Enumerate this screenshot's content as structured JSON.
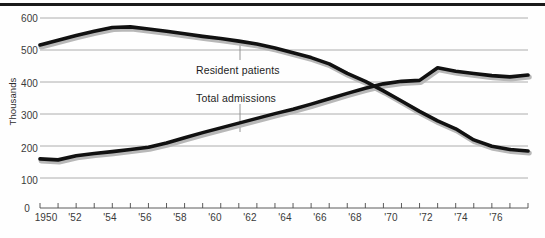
{
  "chart_data": {
    "type": "line",
    "title": "",
    "subtitle": "",
    "xlabel": "",
    "ylabel": "Thousands",
    "ylim": [
      0,
      600
    ],
    "xlim": [
      1950,
      1977
    ],
    "grid": true,
    "legend_position": "inline-annotations",
    "y_ticks": [
      0,
      100,
      200,
      300,
      400,
      500,
      600
    ],
    "y_tick_labels": [
      "0",
      "100",
      "200",
      "300",
      "400",
      "500",
      "600"
    ],
    "x_ticks": [
      1950,
      1951,
      1952,
      1953,
      1954,
      1955,
      1956,
      1957,
      1958,
      1959,
      1960,
      1961,
      1962,
      1963,
      1964,
      1965,
      1966,
      1967,
      1968,
      1969,
      1970,
      1971,
      1972,
      1973,
      1974,
      1975,
      1976,
      1977
    ],
    "x_tick_labels": [
      "1950",
      "",
      "'52",
      "",
      "'54",
      "",
      "'56",
      "",
      "'58",
      "",
      "'60",
      "",
      "'62",
      "",
      "'64",
      "",
      "'66",
      "",
      "'68",
      "",
      "'70",
      "",
      "'72",
      "",
      "'74",
      "",
      "'76",
      ""
    ],
    "x": [
      1950,
      1951,
      1952,
      1953,
      1954,
      1955,
      1956,
      1957,
      1958,
      1959,
      1960,
      1961,
      1962,
      1963,
      1964,
      1965,
      1966,
      1967,
      1968,
      1969,
      1970,
      1971,
      1972,
      1973,
      1974,
      1975,
      1976,
      1977
    ],
    "series": [
      {
        "name": "Resident patients",
        "color": "#111111",
        "values": [
          515,
          530,
          545,
          558,
          570,
          572,
          565,
          558,
          550,
          542,
          535,
          527,
          518,
          505,
          490,
          475,
          455,
          425,
          400,
          370,
          338,
          305,
          275,
          250,
          215,
          195,
          185,
          180
        ]
      },
      {
        "name": "Total admissions",
        "color": "#111111",
        "values": [
          155,
          152,
          165,
          172,
          178,
          185,
          192,
          205,
          222,
          238,
          253,
          268,
          283,
          298,
          312,
          328,
          345,
          362,
          378,
          392,
          400,
          403,
          443,
          432,
          425,
          418,
          414,
          420
        ]
      }
    ],
    "annotations": [
      {
        "name": "Resident patients",
        "text": "Resident patients",
        "leader": true
      },
      {
        "name": "Total admissions",
        "text": "Total admissions",
        "leader": true
      }
    ]
  },
  "axis": {
    "y_label": "Thousands",
    "y_tick_600": "600",
    "y_tick_500": "500",
    "y_tick_400": "400",
    "y_tick_300": "300",
    "y_tick_200": "200",
    "y_tick_100": "100",
    "y_tick_0": "0",
    "x_tick_1950": "1950",
    "x_tick_1952": "'52",
    "x_tick_1954": "'54",
    "x_tick_1956": "'56",
    "x_tick_1958": "'58",
    "x_tick_1960": "'60",
    "x_tick_1962": "'62",
    "x_tick_1964": "'64",
    "x_tick_1966": "'66",
    "x_tick_1968": "'68",
    "x_tick_1970": "'70",
    "x_tick_1972": "'72",
    "x_tick_1974": "'74",
    "x_tick_1976": "'76"
  },
  "labels": {
    "resident_patients": "Resident patients",
    "total_admissions": "Total admissions"
  },
  "colors": {
    "line": "#111111",
    "grid": "#9a9a9a",
    "rule": "#1a1a1a",
    "text": "#3a3a3a"
  }
}
